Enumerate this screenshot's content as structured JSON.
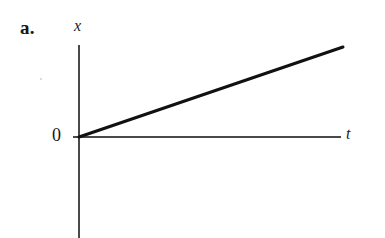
{
  "figure": {
    "panel_label": "a.",
    "background_color": "#ffffff",
    "width": 385,
    "height": 238
  },
  "axes": {
    "y_label": "x",
    "x_label": "t",
    "origin_label": "0",
    "axis_color": "#4a4a4a",
    "origin_px": {
      "x": 79,
      "y": 137
    },
    "x_axis": {
      "x_start": 73,
      "x_end": 341,
      "y": 137
    },
    "y_axis": {
      "x": 79,
      "y_start": 45,
      "y_end": 238
    }
  },
  "chart_data": {
    "type": "line",
    "title": "",
    "subtitle": "",
    "xlabel": "t",
    "ylabel": "x",
    "grid": false,
    "legend": null,
    "axis_ticks": {
      "x": [],
      "y": []
    },
    "annotations": [
      {
        "text": "a.",
        "role": "panel-label"
      },
      {
        "text": "0",
        "role": "origin-label"
      }
    ],
    "xlim": [
      0,
      1
    ],
    "ylim": [
      0,
      1
    ],
    "series": [
      {
        "name": "position",
        "color": "#111111",
        "line_width": 3,
        "description": "straight line of constant positive slope through the origin",
        "x": [
          0,
          1
        ],
        "y": [
          0,
          1
        ],
        "points_px": [
          {
            "x": 79,
            "y": 137
          },
          {
            "x": 343,
            "y": 47
          }
        ]
      }
    ]
  }
}
